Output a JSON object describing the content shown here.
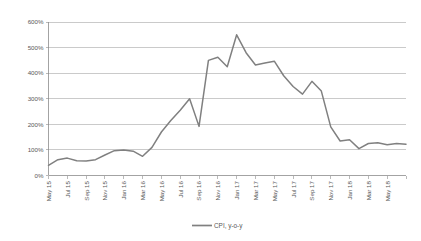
{
  "chart_data": {
    "type": "line",
    "title": "",
    "xlabel": "",
    "ylabel": "",
    "ylim": [
      0,
      600
    ],
    "ytick_labels": [
      "0%",
      "100%",
      "200%",
      "300%",
      "400%",
      "500%",
      "600%"
    ],
    "ytick_values": [
      0,
      100,
      200,
      300,
      400,
      500,
      600
    ],
    "grid": true,
    "legend_position": "bottom",
    "legend": [
      "CPI, y-o-y"
    ],
    "series_color": "#808080",
    "xtick_labels": [
      "May 15",
      "Jul 15",
      "Sep 15",
      "Nov 15",
      "Jan 16",
      "Mar 16",
      "May 16",
      "Jul 16",
      "Sep 16",
      "Nov 16",
      "Jan 17",
      "Mar 17",
      "May 17",
      "Jul 17",
      "Sep 17",
      "Nov 17",
      "Jan 18",
      "Mar 18",
      "May 18"
    ],
    "categories": [
      "May 15",
      "Jun 15",
      "Jul 15",
      "Aug 15",
      "Sep 15",
      "Oct 15",
      "Nov 15",
      "Dec 15",
      "Jan 16",
      "Feb 16",
      "Mar 16",
      "Apr 16",
      "May 16",
      "Jun 16",
      "Jul 16",
      "Aug 16",
      "Sep 16",
      "Oct 16",
      "Nov 16",
      "Dec 16",
      "Jan 17",
      "Feb 17",
      "Mar 17",
      "Apr 17",
      "May 17",
      "Jun 17",
      "Jul 17",
      "Aug 17",
      "Sep 17",
      "Oct 17",
      "Nov 17",
      "Dec 17",
      "Jan 18",
      "Feb 18",
      "Mar 18",
      "Apr 18",
      "May 18",
      "Jun 18",
      "Jul 18"
    ],
    "series": [
      {
        "name": "CPI, y-o-y",
        "values": [
          40,
          62,
          68,
          58,
          57,
          62,
          80,
          97,
          100,
          95,
          75,
          110,
          170,
          215,
          255,
          300,
          192,
          450,
          462,
          425,
          550,
          480,
          432,
          440,
          447,
          390,
          348,
          318,
          368,
          330,
          190,
          135,
          140,
          105,
          125,
          128,
          120,
          125,
          122
        ]
      }
    ]
  }
}
